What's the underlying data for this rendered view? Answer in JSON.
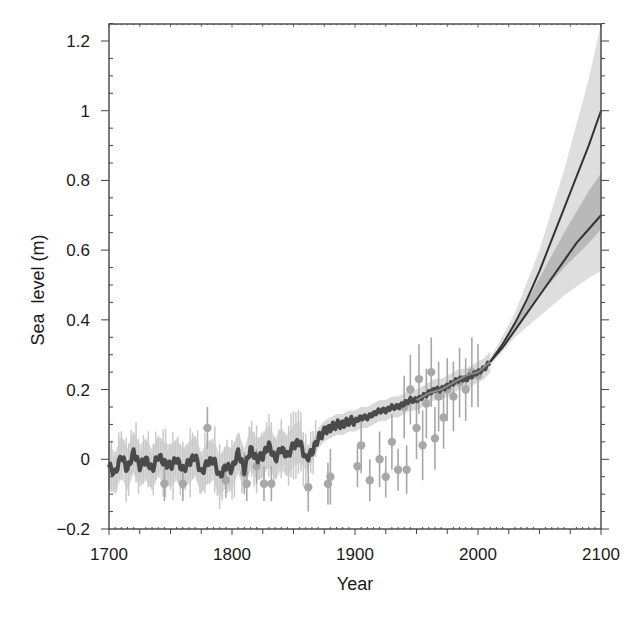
{
  "chart_data": {
    "type": "line",
    "title": "",
    "xlabel": "Year",
    "ylabel": "Sea  level (m)",
    "xlim": [
      1700,
      2100
    ],
    "ylim": [
      -0.2,
      1.25
    ],
    "x_ticks": [
      1700,
      1800,
      1900,
      2000,
      2100
    ],
    "x_tick_labels": [
      "1700",
      "1800",
      "1900",
      "2000",
      "2100"
    ],
    "y_ticks": [
      -0.2,
      0,
      0.2,
      0.4,
      0.6,
      0.8,
      1.0,
      1.2
    ],
    "y_tick_labels": [
      "−0.2",
      "0",
      "0.2",
      "0.4",
      "0.6",
      "0.8",
      "1",
      "1.2"
    ],
    "grid": false,
    "legend": null,
    "colors": {
      "reconstruction": "#4a4a4a",
      "reconstruction_band": "#cfcfcf",
      "proxy_points": "#a8a8a8",
      "instrumental": "#8c8c8c",
      "projection_line": "#333333",
      "projection_outer_band": "#dedede",
      "projection_inner_band": "#b9b9b9",
      "frame": "#444444"
    },
    "series": [
      {
        "name": "Reconstructed sea level (dark line)",
        "x": [
          1700,
          1705,
          1710,
          1715,
          1720,
          1725,
          1730,
          1735,
          1740,
          1745,
          1750,
          1755,
          1760,
          1765,
          1770,
          1775,
          1780,
          1785,
          1790,
          1795,
          1800,
          1805,
          1810,
          1815,
          1820,
          1825,
          1830,
          1835,
          1840,
          1845,
          1850,
          1855,
          1860,
          1865,
          1870,
          1875,
          1880,
          1885,
          1890,
          1895,
          1900,
          1905,
          1910,
          1915,
          1920,
          1925,
          1930,
          1935,
          1940,
          1945,
          1950,
          1955,
          1960,
          1965,
          1970,
          1975,
          1980,
          1985,
          1990,
          1995,
          2000,
          2005,
          2010
        ],
        "values": [
          -0.02,
          -0.04,
          0.01,
          -0.03,
          0.02,
          -0.02,
          0.0,
          -0.03,
          0.01,
          -0.01,
          -0.02,
          0.0,
          -0.03,
          -0.01,
          0.01,
          -0.04,
          -0.01,
          0.0,
          -0.05,
          -0.02,
          -0.03,
          0.02,
          -0.03,
          0.03,
          0.0,
          0.01,
          0.04,
          0.0,
          0.03,
          0.01,
          0.04,
          0.05,
          0.0,
          0.02,
          0.06,
          0.08,
          0.09,
          0.1,
          0.1,
          0.11,
          0.11,
          0.12,
          0.12,
          0.13,
          0.14,
          0.14,
          0.15,
          0.15,
          0.16,
          0.17,
          0.17,
          0.18,
          0.19,
          0.2,
          0.2,
          0.21,
          0.22,
          0.23,
          0.23,
          0.24,
          0.25,
          0.26,
          0.28
        ]
      },
      {
        "name": "Instrumental record (light line)",
        "x": [
          1950,
          1960,
          1970,
          1980,
          1990,
          2000,
          2010
        ],
        "values": [
          0.17,
          0.19,
          0.2,
          0.22,
          0.24,
          0.25,
          0.28
        ]
      },
      {
        "name": "Projection (upper scenario)",
        "x": [
          2010,
          2020,
          2030,
          2040,
          2050,
          2060,
          2070,
          2080,
          2090,
          2100
        ],
        "values": [
          0.28,
          0.33,
          0.39,
          0.46,
          0.54,
          0.63,
          0.72,
          0.81,
          0.9,
          1.0
        ]
      },
      {
        "name": "Projection (lower scenario)",
        "x": [
          2010,
          2020,
          2030,
          2040,
          2050,
          2060,
          2070,
          2080,
          2090,
          2100
        ],
        "values": [
          0.28,
          0.32,
          0.37,
          0.42,
          0.47,
          0.52,
          0.57,
          0.62,
          0.66,
          0.7
        ]
      },
      {
        "name": "Projection outer uncertainty band",
        "x": [
          2010,
          2030,
          2050,
          2070,
          2090,
          2100
        ],
        "upper": [
          0.29,
          0.42,
          0.6,
          0.83,
          1.09,
          1.25
        ],
        "lower": [
          0.27,
          0.35,
          0.41,
          0.47,
          0.52,
          0.54
        ]
      },
      {
        "name": "Projection inner uncertainty band",
        "x": [
          2010,
          2030,
          2050,
          2070,
          2090,
          2100
        ],
        "upper": [
          0.285,
          0.39,
          0.52,
          0.65,
          0.77,
          0.82
        ],
        "lower": [
          0.275,
          0.37,
          0.47,
          0.55,
          0.62,
          0.66
        ]
      },
      {
        "name": "Proxy data points with error bars",
        "points": [
          {
            "x": 1745,
            "y": -0.07,
            "err": 0.05
          },
          {
            "x": 1760,
            "y": -0.07,
            "err": 0.05
          },
          {
            "x": 1780,
            "y": 0.09,
            "err": 0.06
          },
          {
            "x": 1795,
            "y": -0.06,
            "err": 0.05
          },
          {
            "x": 1810,
            "y": -0.04,
            "err": 0.06
          },
          {
            "x": 1812,
            "y": -0.07,
            "err": 0.05
          },
          {
            "x": 1820,
            "y": -0.02,
            "err": 0.05
          },
          {
            "x": 1826,
            "y": -0.07,
            "err": 0.05
          },
          {
            "x": 1832,
            "y": -0.07,
            "err": 0.05
          },
          {
            "x": 1862,
            "y": -0.08,
            "err": 0.07
          },
          {
            "x": 1878,
            "y": -0.07,
            "err": 0.06
          },
          {
            "x": 1880,
            "y": -0.05,
            "err": 0.08
          },
          {
            "x": 1902,
            "y": -0.02,
            "err": 0.06
          },
          {
            "x": 1905,
            "y": 0.04,
            "err": 0.08
          },
          {
            "x": 1912,
            "y": -0.06,
            "err": 0.06
          },
          {
            "x": 1920,
            "y": 0.0,
            "err": 0.08
          },
          {
            "x": 1925,
            "y": -0.05,
            "err": 0.06
          },
          {
            "x": 1930,
            "y": 0.05,
            "err": 0.08
          },
          {
            "x": 1935,
            "y": -0.03,
            "err": 0.06
          },
          {
            "x": 1940,
            "y": 0.15,
            "err": 0.09
          },
          {
            "x": 1942,
            "y": -0.03,
            "err": 0.07
          },
          {
            "x": 1945,
            "y": 0.2,
            "err": 0.1
          },
          {
            "x": 1950,
            "y": 0.09,
            "err": 0.09
          },
          {
            "x": 1952,
            "y": 0.23,
            "err": 0.1
          },
          {
            "x": 1955,
            "y": 0.04,
            "err": 0.1
          },
          {
            "x": 1958,
            "y": 0.16,
            "err": 0.1
          },
          {
            "x": 1962,
            "y": 0.25,
            "err": 0.1
          },
          {
            "x": 1965,
            "y": 0.06,
            "err": 0.09
          },
          {
            "x": 1968,
            "y": 0.18,
            "err": 0.1
          },
          {
            "x": 1972,
            "y": 0.12,
            "err": 0.09
          },
          {
            "x": 1975,
            "y": 0.2,
            "err": 0.09
          },
          {
            "x": 1980,
            "y": 0.18,
            "err": 0.1
          },
          {
            "x": 1985,
            "y": 0.22,
            "err": 0.1
          },
          {
            "x": 1990,
            "y": 0.2,
            "err": 0.09
          },
          {
            "x": 1995,
            "y": 0.25,
            "err": 0.1
          },
          {
            "x": 2000,
            "y": 0.24,
            "err": 0.09
          }
        ]
      }
    ]
  }
}
